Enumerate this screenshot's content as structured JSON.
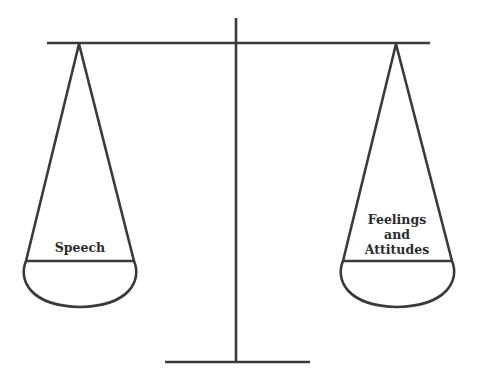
{
  "diagram": {
    "type": "balance-scale",
    "stroke_color": "#3a3a3a",
    "background": "#ffffff",
    "left_pan": {
      "label": "Speech"
    },
    "right_pan": {
      "label": "Feelings\nand\nAttitudes"
    }
  }
}
